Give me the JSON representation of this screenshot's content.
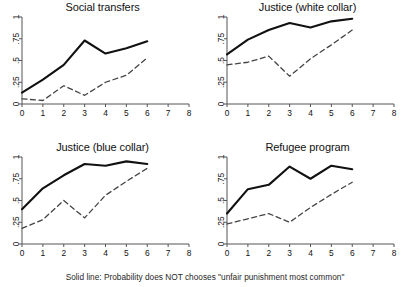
{
  "figure": {
    "caption": "Solid line: Probability does NOT chooses \"unfair punishment most common\"",
    "solid_color": "#111111",
    "dashed_color": "#444444",
    "axis_color": "#555555",
    "background": "#ffffff"
  },
  "axes": {
    "x_ticks": [
      "0",
      "1",
      "2",
      "3",
      "4",
      "5",
      "6",
      "7",
      "8"
    ],
    "y_ticks": [
      "0",
      ".25",
      ".5",
      ".75",
      "1"
    ],
    "xlim": [
      0,
      8
    ],
    "ylim": [
      0,
      1
    ],
    "xlabel": "",
    "ylabel": "",
    "grid": false,
    "legend": "none"
  },
  "chart_data": [
    {
      "type": "line",
      "title": "Social transfers",
      "xlabel": "",
      "ylabel": "",
      "xlim": [
        0,
        8
      ],
      "ylim": [
        0,
        1
      ],
      "x": [
        0,
        1,
        2,
        3,
        4,
        5,
        6
      ],
      "grid": false,
      "legend": "none",
      "series": [
        {
          "name": "Solid line: Probability does NOT chooses \"unfair punishment most common\"",
          "style": "solid",
          "values": [
            0.13,
            0.28,
            0.45,
            0.73,
            0.58,
            0.64,
            0.72
          ]
        },
        {
          "name": "Dashed line",
          "style": "dashed",
          "values": [
            0.06,
            0.04,
            0.21,
            0.1,
            0.25,
            0.33,
            0.53
          ]
        }
      ]
    },
    {
      "type": "line",
      "title": "Justice (white collar)",
      "xlabel": "",
      "ylabel": "",
      "xlim": [
        0,
        8
      ],
      "ylim": [
        0,
        1
      ],
      "x": [
        0,
        1,
        2,
        3,
        4,
        5,
        6
      ],
      "grid": false,
      "legend": "none",
      "series": [
        {
          "name": "Solid line: Probability does NOT chooses \"unfair punishment most common\"",
          "style": "solid",
          "values": [
            0.57,
            0.74,
            0.85,
            0.93,
            0.88,
            0.95,
            0.98
          ]
        },
        {
          "name": "Dashed line",
          "style": "dashed",
          "values": [
            0.45,
            0.48,
            0.55,
            0.32,
            0.52,
            0.68,
            0.85
          ]
        }
      ]
    },
    {
      "type": "line",
      "title": "Justice (blue collar)",
      "xlabel": "",
      "ylabel": "",
      "xlim": [
        0,
        8
      ],
      "ylim": [
        0,
        1
      ],
      "x": [
        0,
        1,
        2,
        3,
        4,
        5,
        6
      ],
      "grid": false,
      "legend": "none",
      "series": [
        {
          "name": "Solid line: Probability does NOT chooses \"unfair punishment most common\"",
          "style": "solid",
          "values": [
            0.4,
            0.64,
            0.79,
            0.92,
            0.9,
            0.95,
            0.92
          ]
        },
        {
          "name": "Dashed line",
          "style": "dashed",
          "values": [
            0.18,
            0.28,
            0.5,
            0.3,
            0.56,
            0.72,
            0.87
          ]
        }
      ]
    },
    {
      "type": "line",
      "title": "Refugee program",
      "xlabel": "",
      "ylabel": "",
      "xlim": [
        0,
        8
      ],
      "ylim": [
        0,
        1
      ],
      "x": [
        0,
        1,
        2,
        3,
        4,
        5,
        6
      ],
      "grid": false,
      "legend": "none",
      "series": [
        {
          "name": "Solid line: Probability does NOT chooses \"unfair punishment most common\"",
          "style": "solid",
          "values": [
            0.35,
            0.63,
            0.68,
            0.89,
            0.75,
            0.9,
            0.86
          ]
        },
        {
          "name": "Dashed line",
          "style": "dashed",
          "values": [
            0.23,
            0.29,
            0.35,
            0.25,
            0.42,
            0.57,
            0.71
          ]
        }
      ]
    }
  ]
}
